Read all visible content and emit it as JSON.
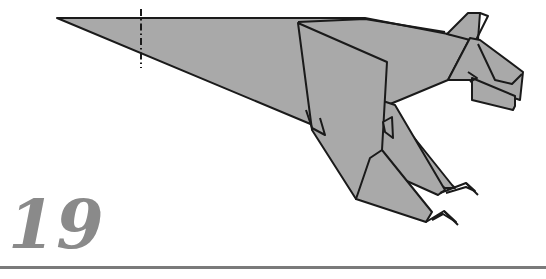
{
  "diagram": {
    "step": {
      "number": "19"
    },
    "colors": {
      "paper_fill": "#a9a9a9",
      "outline": "#1a1a1a",
      "step_number": "#8a8a8a",
      "rule": "#7a7a7a",
      "background": "#ffffff"
    },
    "symbols": [
      {
        "type": "dash-dot-fold-line",
        "orientation": "vertical",
        "position": "across tail"
      }
    ]
  }
}
